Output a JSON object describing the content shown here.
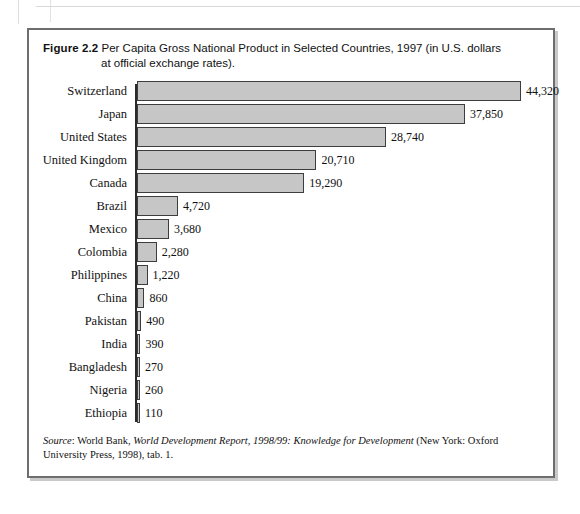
{
  "figure": {
    "label": "Figure 2.2",
    "caption_line1": "Per Capita Gross National Product in Selected Countries, 1997 (in U.S. dollars",
    "caption_line2": "at official exchange rates)."
  },
  "source": {
    "prefix": "Source",
    "colon": ":",
    "publisher": " World Bank, ",
    "title_italic": "World Development Report, 1998/99: Knowledge for Development",
    "tail": " (New York: Oxford University Press, 1998), tab. 1."
  },
  "colors": {
    "bar_fill": "#c6c6c6",
    "bar_stroke": "#3d3d3d",
    "axis": "#2b2b2b",
    "frame": "#6e6e6e",
    "shadow": "#c9c9c9",
    "text": "#111111"
  },
  "chart_data": {
    "type": "bar",
    "orientation": "horizontal",
    "title": "Per Capita Gross National Product in Selected Countries, 1997 (in U.S. dollars at official exchange rates).",
    "xlabel": "",
    "ylabel": "",
    "grid": false,
    "legend": "none",
    "xlim": [
      0,
      44320
    ],
    "units": "U.S. dollars",
    "categories": [
      "Switzerland",
      "Japan",
      "United States",
      "United Kingdom",
      "Canada",
      "Brazil",
      "Mexico",
      "Colombia",
      "Philippines",
      "China",
      "Pakistan",
      "India",
      "Bangladesh",
      "Nigeria",
      "Ethiopia"
    ],
    "values": [
      44320,
      37850,
      28740,
      20710,
      19290,
      4720,
      3680,
      2280,
      1220,
      860,
      490,
      390,
      270,
      260,
      110
    ],
    "value_labels": [
      "44,320",
      "37,850",
      "28,740",
      "20,710",
      "19,290",
      "4,720",
      "3,680",
      "2,280",
      "1,220",
      "860",
      "490",
      "390",
      "270",
      "260",
      "110"
    ]
  }
}
